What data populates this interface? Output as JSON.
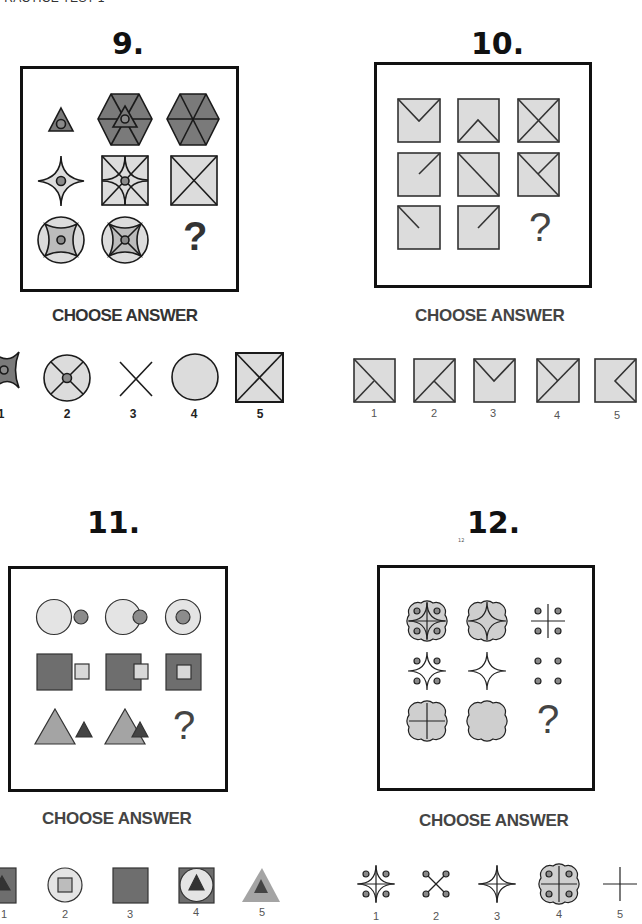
{
  "header": {
    "title": "PRACTICE TEST 1"
  },
  "questions": [
    {
      "number": "9.",
      "grid": [
        [
          "triangle-with-dot",
          "hexagon-with-triangle-and-dot",
          "hexagon-divided"
        ],
        [
          "concave-star-with-dot",
          "square-with-arcs-and-dot",
          "square-with-x"
        ],
        [
          "circle-with-concave-square-and-dot",
          "circle-with-concave-square-x-and-dot",
          "?"
        ]
      ],
      "missing": "?",
      "choose_label": "CHOOSE ANSWER",
      "answers": [
        {
          "label": "1",
          "shape": "concave-shape-with-dot"
        },
        {
          "label": "2",
          "shape": "circle-with-x-and-dot"
        },
        {
          "label": "3",
          "shape": "x-lines"
        },
        {
          "label": "4",
          "shape": "plain-circle"
        },
        {
          "label": "5",
          "shape": "square-with-x"
        }
      ]
    },
    {
      "number": "10.",
      "grid": [
        [
          "square-v-top",
          "square-caret-bottom",
          "square-x"
        ],
        [
          "square-diag-top-right-half",
          "square-diag-full",
          "square-diag-plus-half"
        ],
        [
          "square-diag-top-left-half",
          "square-diag-top-right-half",
          "?"
        ]
      ],
      "missing": "?",
      "choose_label": "CHOOSE ANSWER",
      "answers": [
        {
          "label": "1",
          "shape": "square-diag-tl-br-plus-bl-half"
        },
        {
          "label": "2",
          "shape": "square-diag-tr-bl-plus-br-half"
        },
        {
          "label": "3",
          "shape": "square-v-top"
        },
        {
          "label": "4",
          "shape": "square-diag-tr-bl-plus-tl-half"
        },
        {
          "label": "5",
          "shape": "square-left-caret"
        }
      ]
    },
    {
      "number": "11.",
      "grid": [
        [
          "circle-beside-dot",
          "circle-overlap-dot",
          "circle-contains-dot"
        ],
        [
          "square-beside-small-square",
          "square-overlap-small-square",
          "square-contains-small-square"
        ],
        [
          "triangle-beside-small-triangle",
          "triangle-overlap-small-triangle",
          "?"
        ]
      ],
      "missing": "?",
      "choose_label": "CHOOSE ANSWER",
      "answers": [
        {
          "label": "1",
          "shape": "square-with-triangle"
        },
        {
          "label": "2",
          "shape": "circle-with-square"
        },
        {
          "label": "3",
          "shape": "plain-square"
        },
        {
          "label": "4",
          "shape": "square-circle-triangle"
        },
        {
          "label": "5",
          "shape": "triangle-in-triangle"
        }
      ]
    },
    {
      "number": "12.",
      "small_mark": "12",
      "grid": [
        [
          "clover-star-cross-dots",
          "clover-star",
          "cross-dots"
        ],
        [
          "star-dots",
          "star",
          "dots"
        ],
        [
          "clover-cross",
          "clover",
          "?"
        ]
      ],
      "missing": "?",
      "choose_label": "CHOOSE ANSWER",
      "answers": [
        {
          "label": "1",
          "shape": "star-cross-dots"
        },
        {
          "label": "2",
          "shape": "x-with-dots"
        },
        {
          "label": "3",
          "shape": "star-cross"
        },
        {
          "label": "4",
          "shape": "clover-cross-dots"
        },
        {
          "label": "5",
          "shape": "cross"
        }
      ]
    }
  ],
  "colors": {
    "dark_fill": "#7a7a7a",
    "mid_fill": "#a8a8a8",
    "light_fill": "#dcdcdc",
    "dot_fill": "#8a8a8a",
    "stroke": "#1a1a1a"
  }
}
